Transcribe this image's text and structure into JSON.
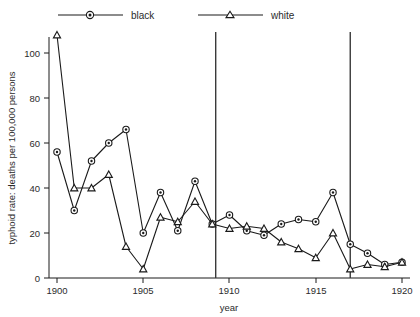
{
  "chart_data": {
    "type": "line",
    "title": "",
    "xlabel": "year",
    "ylabel": "typhoid rate: deaths per 100,000 persons",
    "xlim": [
      1899.3,
      1920.6
    ],
    "ylim": [
      0,
      112
    ],
    "xticks": [
      1900,
      1905,
      1910,
      1915,
      1920
    ],
    "xtick_labels": [
      "1900",
      "1905",
      "1910",
      "1915",
      "1920"
    ],
    "yticks": [
      0,
      20,
      40,
      60,
      80,
      100
    ],
    "ytick_labels": [
      "0",
      "20",
      "40",
      "60",
      "80",
      "100"
    ],
    "grid": false,
    "legend_position": "top",
    "x": [
      1900,
      1901,
      1902,
      1903,
      1904,
      1905,
      1906,
      1907,
      1908,
      1909,
      1910,
      1911,
      1912,
      1913,
      1914,
      1915,
      1916,
      1917,
      1918,
      1919,
      1920
    ],
    "series": [
      {
        "name": "black",
        "marker": "circle",
        "values": [
          56,
          30,
          52,
          60,
          66,
          20,
          38,
          21,
          43,
          24,
          28,
          21,
          19,
          24,
          26,
          25,
          38,
          15,
          11,
          6,
          7
        ]
      },
      {
        "name": "white",
        "marker": "triangle",
        "values": [
          108,
          40,
          40,
          46,
          14,
          4,
          27,
          25,
          34,
          24,
          22,
          23,
          22,
          16,
          13,
          9,
          20,
          4,
          6,
          5,
          7
        ]
      }
    ],
    "annotations": [
      {
        "type": "vertical-line",
        "x": 1909.2,
        "label": ""
      },
      {
        "type": "vertical-line",
        "x": 1917.0,
        "label": ""
      }
    ],
    "legend": [
      {
        "label": "black",
        "marker": "circle"
      },
      {
        "label": "white",
        "marker": "triangle"
      }
    ]
  }
}
